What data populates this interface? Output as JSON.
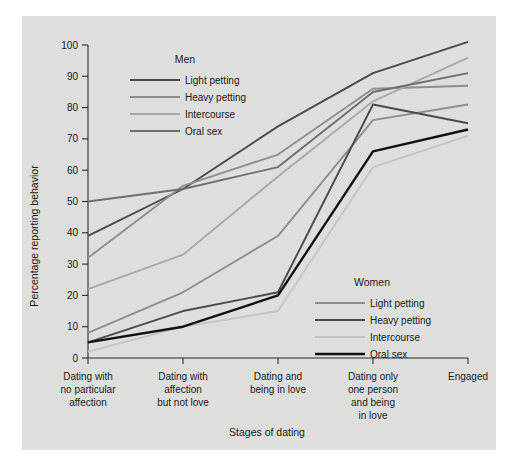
{
  "figure": {
    "background_color": "#dededd",
    "page_color": "#ffffff"
  },
  "axes": {
    "ylabel": "Percentage reporting behavior",
    "xlabel": "Stages of dating",
    "yticks": [
      "0",
      "10",
      "20",
      "30",
      "40",
      "50",
      "60",
      "70",
      "80",
      "90",
      "100"
    ],
    "xtick_labels": [
      [
        "Dating with",
        "no particular",
        "affection"
      ],
      [
        "Dating with",
        "affection",
        "but not love"
      ],
      [
        "Dating and",
        "being in love"
      ],
      [
        "Dating only",
        "one person",
        "and being",
        "in love"
      ],
      [
        "Engaged"
      ]
    ]
  },
  "legends": {
    "men": {
      "title": "Men",
      "items": [
        {
          "label": "Light petting",
          "color": "#4a4a4a"
        },
        {
          "label": "Heavy petting",
          "color": "#8e8e8e"
        },
        {
          "label": "Intercourse",
          "color": "#a9a9a9"
        },
        {
          "label": "Oral sex",
          "color": "#6e6e6e"
        }
      ]
    },
    "women": {
      "title": "Women",
      "items": [
        {
          "label": "Light petting",
          "color": "#8e8e8e"
        },
        {
          "label": "Heavy petting",
          "color": "#4a4a4a"
        },
        {
          "label": "Intercourse",
          "color": "#c5c5c5"
        },
        {
          "label": "Oral sex",
          "color": "#111111"
        }
      ]
    }
  },
  "chart_data": {
    "type": "line",
    "title": "",
    "xlabel": "Stages of dating",
    "ylabel": "Percentage reporting behavior",
    "ylim": [
      0,
      100
    ],
    "grid": false,
    "legend_position": "inside-top-left and inside-bottom-right",
    "categories": [
      "Dating with no particular affection",
      "Dating with affection but not love",
      "Dating and being in love",
      "Dating only one person and being in love",
      "Engaged"
    ],
    "series": [
      {
        "name": "Men - Light petting",
        "group": "Men",
        "color": "#4a4a4a",
        "width": 1.9,
        "values": [
          39,
          54,
          74,
          91,
          101
        ]
      },
      {
        "name": "Men - Heavy petting",
        "group": "Men",
        "color": "#8e8e8e",
        "width": 1.9,
        "values": [
          32,
          55,
          65,
          86,
          87
        ]
      },
      {
        "name": "Men - Intercourse",
        "group": "Men",
        "color": "#a9a9a9",
        "width": 1.9,
        "values": [
          22,
          33,
          58,
          82,
          96
        ]
      },
      {
        "name": "Men - Oral sex",
        "group": "Men",
        "color": "#6e6e6e",
        "width": 1.9,
        "values": [
          50,
          54,
          61,
          85,
          91
        ]
      },
      {
        "name": "Women - Light petting",
        "group": "Women",
        "color": "#8e8e8e",
        "width": 1.9,
        "values": [
          8,
          21,
          39,
          76,
          81
        ]
      },
      {
        "name": "Women - Heavy petting",
        "group": "Women",
        "color": "#4a4a4a",
        "width": 1.9,
        "values": [
          5,
          15,
          21,
          81,
          75
        ]
      },
      {
        "name": "Women - Intercourse",
        "group": "Women",
        "color": "#c5c5c5",
        "width": 1.9,
        "values": [
          2,
          10,
          15,
          61,
          71
        ]
      },
      {
        "name": "Women - Oral sex",
        "group": "Women",
        "color": "#111111",
        "width": 2.4,
        "values": [
          5,
          10,
          20,
          66,
          73
        ]
      }
    ]
  }
}
